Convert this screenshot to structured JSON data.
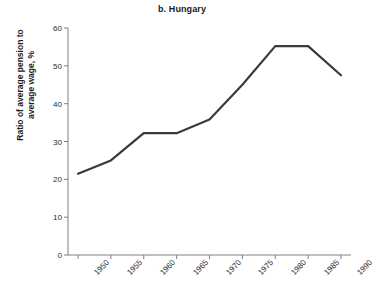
{
  "chart_data": {
    "type": "line",
    "title": "b. Hungary",
    "xlabel": "",
    "ylabel": "Ratio of average pension to average wage, %",
    "ylabel_lines": [
      "Ratio of average pension to",
      "average wage, %"
    ],
    "categories": [
      "1950",
      "1955",
      "1960",
      "1965",
      "1970",
      "1975",
      "1980",
      "1985",
      "1990"
    ],
    "x": [
      1950,
      1955,
      1960,
      1965,
      1970,
      1975,
      1980,
      1985,
      1990
    ],
    "values": [
      21.5,
      25.0,
      32.2,
      32.2,
      35.8,
      45.0,
      55.2,
      55.2,
      47.5
    ],
    "series": [
      {
        "name": "Ratio of average pension to average wage",
        "values": [
          21.5,
          25.0,
          32.2,
          32.2,
          35.8,
          45.0,
          55.2,
          55.2,
          47.5
        ]
      }
    ],
    "ylim": [
      0,
      60
    ],
    "yticks": [
      0,
      10,
      20,
      30,
      40,
      50,
      60
    ],
    "ytick_labels": [
      "0",
      "10",
      "20",
      "30",
      "40",
      "50",
      "60"
    ],
    "xtick_labels": [
      "1950",
      "1955",
      "1960",
      "1965",
      "1970",
      "1975",
      "1980",
      "1985",
      "1990"
    ],
    "xtick_rotation": -45,
    "grid": false,
    "legend": false,
    "legend_position": "none",
    "line_color": "#3a3a3a",
    "line_width": 2.2,
    "axis_color": "#808080",
    "background_color": "#ffffff",
    "text_color": "#1a1a1a"
  }
}
